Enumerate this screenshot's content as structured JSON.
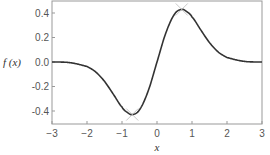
{
  "chart_data": {
    "type": "line",
    "title": "",
    "xlabel": "x",
    "ylabel": "f(x)",
    "xlim": [
      -3,
      3
    ],
    "ylim": [
      -0.5,
      0.49
    ],
    "grid": false,
    "legend": null,
    "x_ticks": [
      "-3",
      "-2",
      "-1",
      "0",
      "1",
      "2",
      "3"
    ],
    "y_ticks": [
      "0.4",
      "0.2",
      "0.0",
      "-0.2",
      "-0.4"
    ],
    "series": [
      {
        "name": "f(x)",
        "color": "#333333",
        "x": [
          -3,
          -2.5,
          -2,
          -1.75,
          -1.5,
          -1.25,
          -1,
          -0.85,
          -0.707,
          -0.5,
          -0.25,
          0,
          0.25,
          0.5,
          0.707,
          0.85,
          1,
          1.25,
          1.5,
          1.75,
          2,
          2.5,
          3
        ],
        "y": [
          -0.0004,
          -0.0048,
          -0.0366,
          -0.0819,
          -0.1581,
          -0.262,
          -0.3679,
          -0.4115,
          -0.4289,
          -0.3894,
          -0.2349,
          0,
          0.2349,
          0.3894,
          0.4289,
          0.4115,
          0.3679,
          0.262,
          0.1581,
          0.0819,
          0.0366,
          0.0048,
          0.0004
        ]
      }
    ],
    "annotations": [
      {
        "type": "x-marker",
        "x": 0.707,
        "y": 0.4289,
        "color": "#bbbbbb",
        "label": "maximum"
      },
      {
        "type": "x-marker",
        "x": -0.707,
        "y": -0.4289,
        "color": "#bbbbbb",
        "label": "minimum"
      }
    ]
  },
  "labels": {
    "xlabel": "x",
    "ylabel": "f (x)"
  }
}
